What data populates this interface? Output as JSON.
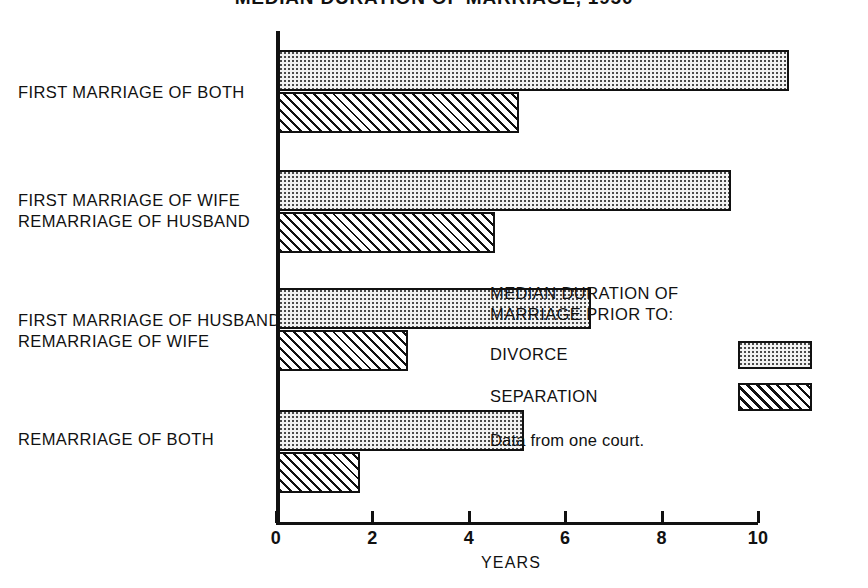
{
  "chart_data": {
    "type": "bar",
    "orientation": "horizontal",
    "title": "MEDIAN DURATION OF MARRIAGE, 1950",
    "xlabel": "YEARS",
    "ylabel": "",
    "xlim": [
      0,
      10.8
    ],
    "xticks": [
      0,
      2,
      4,
      6,
      8,
      10
    ],
    "xtick_labels": [
      "0",
      "2",
      "4",
      "6",
      "8",
      "10"
    ],
    "grid": false,
    "legend_position": "right-middle",
    "categories": [
      "FIRST MARRIAGE OF BOTH",
      "FIRST MARRIAGE OF WIFE / REMARRIAGE OF HUSBAND",
      "FIRST MARRIAGE OF HUSBAND / REMARRIAGE OF WIFE",
      "REMARRIAGE OF BOTH"
    ],
    "category_lines": [
      [
        "FIRST MARRIAGE OF BOTH"
      ],
      [
        "FIRST MARRIAGE OF WIFE",
        "REMARRIAGE OF HUSBAND"
      ],
      [
        "FIRST MARRIAGE OF HUSBAND",
        "REMARRIAGE OF WIFE"
      ],
      [
        "REMARRIAGE OF BOTH"
      ]
    ],
    "series": [
      {
        "name": "DIVORCE",
        "pattern": "stipple",
        "values": [
          10.6,
          9.4,
          6.5,
          5.1
        ]
      },
      {
        "name": "SEPARATION",
        "pattern": "diagonal-hatch",
        "values": [
          5.0,
          4.5,
          2.7,
          1.7
        ]
      }
    ],
    "annotations": [
      "Data from one court."
    ]
  },
  "legend": {
    "title_lines": [
      "MEDIAN DURATION OF",
      "MARRIAGE PRIOR TO:"
    ],
    "entries": [
      {
        "label": "DIVORCE",
        "pattern": "stipple"
      },
      {
        "label": "SEPARATION",
        "pattern": "diagonal-hatch"
      }
    ],
    "note": "Data from one court."
  },
  "colors": {
    "ink": "#111111",
    "background": "#ffffff",
    "stipple_fill": "#f2f2f2",
    "stipple_dot": "#4a4a4a"
  }
}
